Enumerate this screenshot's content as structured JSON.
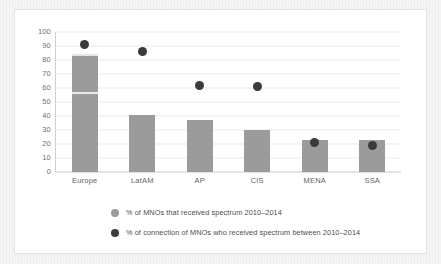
{
  "chart_data": {
    "type": "bar",
    "title": "",
    "subtitle": "",
    "xlabel": "",
    "ylabel": "",
    "ylim": [
      0,
      100
    ],
    "ytick_step": 10,
    "yticks": [
      100,
      90,
      80,
      70,
      60,
      50,
      40,
      30,
      20,
      10,
      0
    ],
    "grid": true,
    "legend_position": "bottom-left",
    "categories": [
      "Europe",
      "LatAM",
      "AP",
      "CIS",
      "MENA",
      "SSA"
    ],
    "series": [
      {
        "name": "% of MNOs that received spectrum 2010–2014",
        "type": "bar",
        "color": "#9b9b9b",
        "values": [
          84,
          41,
          37,
          30,
          23,
          23
        ]
      },
      {
        "name": "% of connection  of MNOs who received spectrum between 2010–2014",
        "type": "scatter",
        "color": "#3b3b3b",
        "values": [
          91,
          86,
          62,
          61,
          21,
          19
        ]
      }
    ]
  },
  "legend": {
    "items": [
      {
        "label": "% of MNOs that received spectrum 2010–2014",
        "color": "#9b9b9b"
      },
      {
        "label": "% of connection  of MNOs who received spectrum between 2010–2014",
        "color": "#3b3b3b"
      }
    ]
  }
}
